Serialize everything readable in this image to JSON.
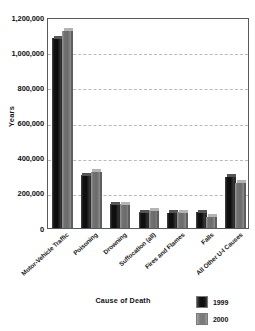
{
  "chart_data": {
    "type": "bar",
    "title": "",
    "xlabel": "Cause of Death",
    "ylabel": "Years",
    "ylim": [
      0,
      1200000
    ],
    "ytick_labels": [
      "1,200,000",
      "1,000,000",
      "800,000",
      "600,000",
      "400,000",
      "200,000",
      "0"
    ],
    "ytick_values": [
      1200000,
      1000000,
      800000,
      600000,
      400000,
      200000,
      0
    ],
    "grid": true,
    "grid_axis": "y",
    "legend_position": "bottom-right",
    "categories": [
      "Motor-Vehicle Traffic",
      "Poisoning",
      "Drowning",
      "Suffocation (all)",
      "Fires and Flames",
      "Falls",
      "All Other U-I Causes"
    ],
    "series": [
      {
        "name": "1999",
        "color": "#111111",
        "values": [
          1080000,
          300000,
          135000,
          90000,
          88000,
          90000,
          290000
        ]
      },
      {
        "name": "2000",
        "color": "#6e6e6e",
        "values": [
          1120000,
          320000,
          135000,
          100000,
          90000,
          65000,
          258000
        ]
      }
    ]
  },
  "legend": {
    "entries": [
      {
        "label": "1999",
        "swatch": "#111111"
      },
      {
        "label": "2000",
        "swatch": "#8a8a8a"
      }
    ]
  }
}
